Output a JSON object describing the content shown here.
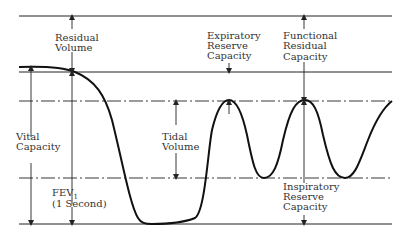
{
  "diagram": {
    "labels": {
      "residual_volume": [
        "Residual",
        "Volume"
      ],
      "expiratory_reserve_capacity": [
        "Expiratory",
        "Reserve",
        "Capacity"
      ],
      "functional_residual_capacity": [
        "Functional",
        "Residual",
        "Capacity"
      ],
      "vital_capacity": [
        "Vital",
        "Capacity"
      ],
      "tidal_volume": [
        "Tidal",
        "Volume"
      ],
      "fev1": [
        "FEV",
        "1",
        "(1 Second)"
      ],
      "inspiratory_reserve_capacity": [
        "Inspiratory",
        "Reserve",
        "Capacity"
      ]
    },
    "levels": {
      "top": "total lung capacity line",
      "residual": "residual volume line",
      "tidal_top": "end expiration (dash-dot)",
      "tidal_bottom": "end inspiration (dash-dot)",
      "bottom": "maximum inspiration line"
    }
  }
}
